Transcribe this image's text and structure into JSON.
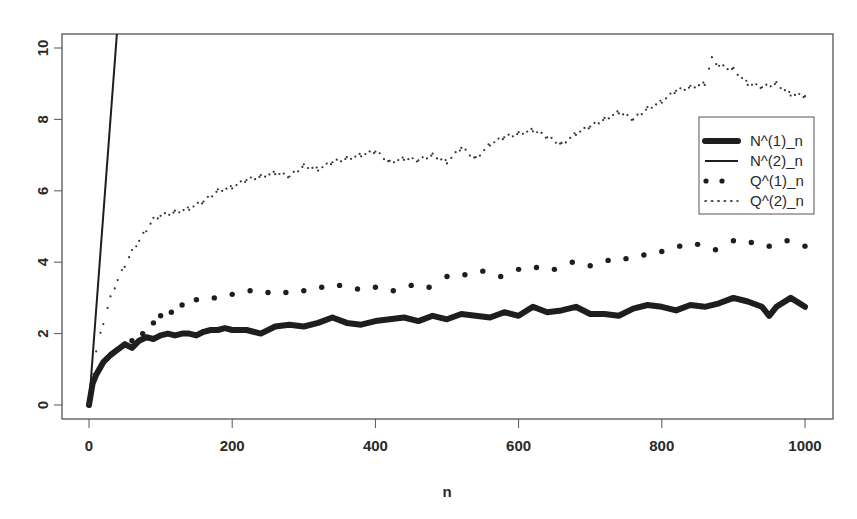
{
  "chart_data": {
    "type": "line",
    "title": "",
    "xlabel": "n",
    "ylabel": "",
    "xlim": [
      0,
      1000
    ],
    "ylim": [
      0,
      10
    ],
    "x_ticks": [
      0,
      200,
      400,
      600,
      800,
      1000
    ],
    "y_ticks": [
      0,
      2,
      4,
      6,
      8,
      10
    ],
    "grid": false,
    "legend_position": "right",
    "series": [
      {
        "name": "N^(1)_n",
        "style": "thick-line",
        "x": [
          0,
          5,
          10,
          20,
          30,
          40,
          50,
          60,
          70,
          80,
          90,
          100,
          110,
          120,
          130,
          140,
          150,
          160,
          170,
          180,
          190,
          200,
          220,
          240,
          260,
          280,
          300,
          320,
          340,
          360,
          380,
          400,
          420,
          440,
          460,
          480,
          500,
          520,
          540,
          560,
          580,
          600,
          620,
          640,
          660,
          680,
          700,
          720,
          740,
          760,
          780,
          800,
          820,
          840,
          860,
          880,
          900,
          920,
          940,
          950,
          960,
          980,
          1000
        ],
        "values": [
          0.0,
          0.6,
          0.85,
          1.2,
          1.4,
          1.55,
          1.7,
          1.6,
          1.8,
          1.9,
          1.85,
          1.95,
          2.0,
          1.95,
          2.0,
          2.0,
          1.95,
          2.05,
          2.1,
          2.1,
          2.15,
          2.1,
          2.1,
          2.0,
          2.2,
          2.25,
          2.2,
          2.3,
          2.45,
          2.3,
          2.25,
          2.35,
          2.4,
          2.45,
          2.35,
          2.5,
          2.4,
          2.55,
          2.5,
          2.45,
          2.6,
          2.5,
          2.75,
          2.6,
          2.65,
          2.75,
          2.55,
          2.55,
          2.5,
          2.7,
          2.8,
          2.75,
          2.65,
          2.8,
          2.75,
          2.85,
          3.0,
          2.9,
          2.75,
          2.5,
          2.75,
          3.0,
          2.75
        ]
      },
      {
        "name": "N^(2)_n",
        "style": "thin-line",
        "x": [
          0,
          39
        ],
        "values": [
          0.0,
          10.4
        ]
      },
      {
        "name": "Q^(1)_n",
        "style": "large-dots",
        "x": [
          0,
          25,
          50,
          60,
          75,
          90,
          100,
          115,
          130,
          150,
          175,
          200,
          225,
          250,
          275,
          300,
          325,
          350,
          375,
          400,
          425,
          450,
          475,
          500,
          525,
          550,
          575,
          600,
          625,
          650,
          675,
          700,
          725,
          750,
          775,
          800,
          825,
          850,
          875,
          900,
          925,
          950,
          975,
          1000
        ],
        "values": [
          0.0,
          1.3,
          1.7,
          1.8,
          2.0,
          2.3,
          2.5,
          2.6,
          2.8,
          2.95,
          3.0,
          3.1,
          3.2,
          3.15,
          3.15,
          3.2,
          3.3,
          3.35,
          3.25,
          3.3,
          3.2,
          3.35,
          3.3,
          3.6,
          3.65,
          3.75,
          3.6,
          3.8,
          3.85,
          3.8,
          4.0,
          3.9,
          4.05,
          4.1,
          4.2,
          4.3,
          4.45,
          4.5,
          4.35,
          4.6,
          4.55,
          4.45,
          4.6,
          4.45
        ]
      },
      {
        "name": "Q^(2)_n",
        "style": "small-dots",
        "x": [
          0,
          10,
          20,
          30,
          40,
          50,
          60,
          70,
          80,
          90,
          100,
          120,
          140,
          160,
          180,
          200,
          220,
          240,
          260,
          280,
          300,
          320,
          340,
          360,
          380,
          400,
          420,
          440,
          460,
          480,
          500,
          520,
          540,
          560,
          580,
          600,
          620,
          640,
          660,
          680,
          700,
          720,
          740,
          760,
          780,
          800,
          820,
          840,
          860,
          870,
          880,
          900,
          920,
          940,
          960,
          980,
          1000
        ],
        "values": [
          0.0,
          1.5,
          2.3,
          3.0,
          3.5,
          3.9,
          4.3,
          4.6,
          4.9,
          5.2,
          5.3,
          5.4,
          5.5,
          5.7,
          6.0,
          6.1,
          6.3,
          6.4,
          6.5,
          6.4,
          6.7,
          6.6,
          6.8,
          6.9,
          7.0,
          7.1,
          6.8,
          6.9,
          6.85,
          7.0,
          6.8,
          7.2,
          6.9,
          7.3,
          7.5,
          7.6,
          7.7,
          7.5,
          7.3,
          7.6,
          7.8,
          8.0,
          8.2,
          8.0,
          8.3,
          8.5,
          8.8,
          8.9,
          9.0,
          9.7,
          9.5,
          9.4,
          9.0,
          8.9,
          9.0,
          8.7,
          8.65
        ]
      }
    ]
  },
  "axes": {
    "x_tick_labels": [
      "0",
      "200",
      "400",
      "600",
      "800",
      "1000"
    ],
    "y_tick_labels": [
      "0",
      "2",
      "4",
      "6",
      "8",
      "10"
    ],
    "x_title": "n"
  },
  "legend": {
    "items": [
      "N^(1)_n",
      "N^(2)_n",
      "Q^(1)_n",
      "Q^(2)_n"
    ]
  },
  "colors": {
    "ink": "#1e1e1e",
    "frame": "#555555",
    "background": "#ffffff"
  }
}
